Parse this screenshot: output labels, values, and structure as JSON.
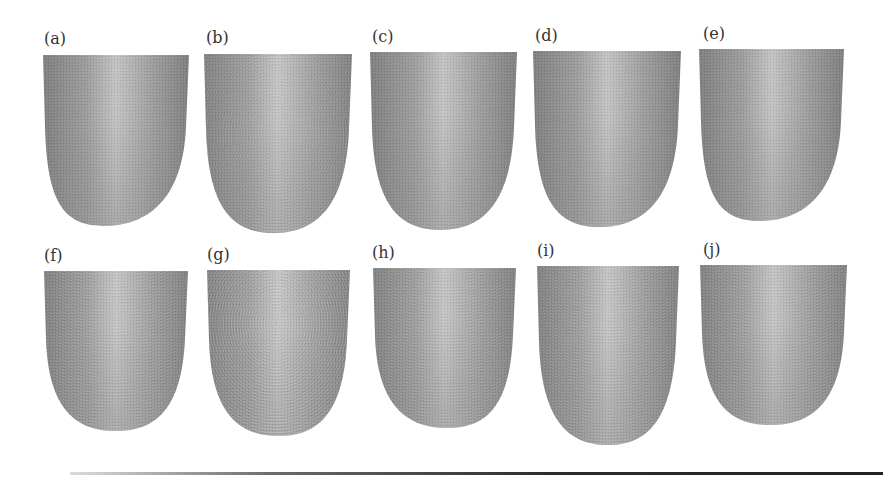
{
  "figure": {
    "background": "#ffffff",
    "label_color": "#333333",
    "skin_colors": {
      "dark": "#7e7e7e",
      "mid": "#9c9c9c",
      "light": "#c2c2c2"
    },
    "panels": [
      {
        "label": "(a)",
        "x": 43,
        "top": 55,
        "width": 146,
        "height": 171,
        "label_x": 44,
        "label_y": 31,
        "pattern": "smooth",
        "tip": 0.42
      },
      {
        "label": "(b)",
        "x": 204,
        "top": 54,
        "width": 148,
        "height": 179,
        "label_x": 206,
        "label_y": 30,
        "pattern": "loop",
        "tip": 0.47
      },
      {
        "label": "(c)",
        "x": 370,
        "top": 52,
        "width": 147,
        "height": 178,
        "label_x": 372,
        "label_y": 29,
        "pattern": "smooth",
        "tip": 0.48
      },
      {
        "label": "(d)",
        "x": 533,
        "top": 51,
        "width": 148,
        "height": 176,
        "label_x": 535,
        "label_y": 28,
        "pattern": "smooth",
        "tip": 0.45
      },
      {
        "label": "(e)",
        "x": 699,
        "top": 49,
        "width": 145,
        "height": 172,
        "label_x": 703,
        "label_y": 26,
        "pattern": "smooth",
        "tip": 0.42
      },
      {
        "label": "(f)",
        "x": 44,
        "top": 271,
        "width": 144,
        "height": 160,
        "label_x": 44,
        "label_y": 248,
        "pattern": "ridges",
        "tip": 0.5
      },
      {
        "label": "(g)",
        "x": 207,
        "top": 270,
        "width": 143,
        "height": 166,
        "label_x": 207,
        "label_y": 247,
        "pattern": "whorl",
        "tip": 0.5
      },
      {
        "label": "(h)",
        "x": 373,
        "top": 268,
        "width": 143,
        "height": 160,
        "label_x": 372,
        "label_y": 245,
        "pattern": "ridges",
        "tip": 0.52
      },
      {
        "label": "(i)",
        "x": 537,
        "top": 266,
        "width": 142,
        "height": 179,
        "label_x": 537,
        "label_y": 243,
        "pattern": "ridges",
        "tip": 0.5
      },
      {
        "label": "(j)",
        "x": 700,
        "top": 265,
        "width": 147,
        "height": 160,
        "label_x": 703,
        "label_y": 242,
        "pattern": "ridges",
        "tip": 0.48
      }
    ]
  }
}
